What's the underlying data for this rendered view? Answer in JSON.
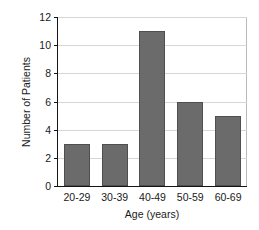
{
  "chart_data": {
    "type": "bar",
    "title": "",
    "categories": [
      "20-29",
      "30-39",
      "40-49",
      "50-59",
      "60-69"
    ],
    "values": [
      3,
      3,
      11,
      6,
      5
    ],
    "xlabel": "Age (years)",
    "ylabel": "Number of Patients",
    "ylim": [
      0,
      12
    ],
    "yticks": [
      0,
      2,
      4,
      6,
      8,
      10,
      12
    ],
    "ytick_labels": [
      "0",
      "2",
      "4",
      "6",
      "8",
      "10",
      "12"
    ],
    "grid": "horizontal",
    "legend": "none",
    "colors": {
      "bar_fill": "#6b6b6b",
      "bar_edge": "#4f4f4f",
      "gridline": "#d6d6d6",
      "axis": "#141414",
      "background": "#ffffff",
      "text": "#1a1a1a"
    }
  }
}
